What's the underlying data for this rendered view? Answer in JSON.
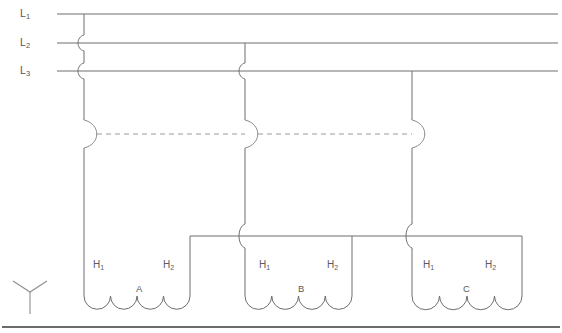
{
  "diagram": {
    "title": "",
    "type": "three-phase-wye-winding-schematic",
    "supply_lines": [
      {
        "id": "L1",
        "label": "L",
        "subscript": "1",
        "y": 14,
        "x_label": 20
      },
      {
        "id": "L2",
        "label": "L",
        "subscript": "2",
        "y": 43,
        "x_label": 20
      },
      {
        "id": "L3",
        "label": "L",
        "subscript": "3",
        "y": 71,
        "x_label": 20
      }
    ],
    "wye_symbol": {
      "name": "wye-connection-symbol",
      "x": 30,
      "y": 292
    },
    "contactors": [
      {
        "id": "contactor-a",
        "x": 84,
        "y": 134,
        "link_left": false,
        "link_right": true
      },
      {
        "id": "contactor-b",
        "x": 245,
        "y": 134,
        "link_left": true,
        "link_right": true
      },
      {
        "id": "contactor-c",
        "x": 412,
        "y": 134,
        "link_left": true,
        "link_right": false
      }
    ],
    "coils": [
      {
        "id": "coil-a",
        "name": "A",
        "terminal_left": "H",
        "terminal_left_sub": "1",
        "terminal_right": "H",
        "terminal_right_sub": "2",
        "x_left": 84,
        "x_right": 190,
        "label_x": 137,
        "label_y": 291
      },
      {
        "id": "coil-b",
        "name": "B",
        "terminal_left": "H",
        "terminal_left_sub": "1",
        "terminal_right": "H",
        "terminal_right_sub": "2",
        "x_left": 245,
        "x_right": 352,
        "label_x": 299,
        "label_y": 291
      },
      {
        "id": "coil-c",
        "name": "C",
        "terminal_left": "H",
        "terminal_left_sub": "1",
        "terminal_right": "H",
        "terminal_right_sub": "2",
        "x_left": 412,
        "x_right": 522,
        "label_x": 464,
        "label_y": 291
      }
    ],
    "terminal_labels": [
      {
        "text": "H",
        "sub": "1",
        "x": 93,
        "y": 265
      },
      {
        "text": "H",
        "sub": "2",
        "x": 163,
        "y": 265
      },
      {
        "text": "H",
        "sub": "1",
        "x": 259,
        "y": 265
      },
      {
        "text": "H",
        "sub": "2",
        "x": 327,
        "y": 265
      },
      {
        "text": "H",
        "sub": "1",
        "x": 423,
        "y": 265
      },
      {
        "text": "H",
        "sub": "2",
        "x": 485,
        "y": 265
      }
    ],
    "coil_labels": [
      {
        "text": "A",
        "x": 136,
        "y": 288
      },
      {
        "text": "B",
        "x": 298,
        "y": 288
      },
      {
        "text": "C",
        "x": 463,
        "y": 288
      }
    ],
    "colors": {
      "wire": "#6e6e72",
      "dashed_link": "#9a9aa0",
      "text": "#55555a",
      "frame": "#3a3a3e",
      "background": "#ffffff"
    },
    "geometry": {
      "bus_y": 236,
      "bus_x_start": 190,
      "bus_x_end": 522,
      "coil_base_y": 310,
      "frame_bottom_y": 327,
      "line_x_end": 558,
      "line_x_start": 57
    }
  }
}
